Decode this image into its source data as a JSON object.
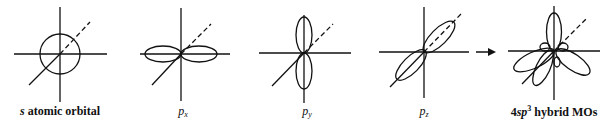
{
  "diagram": {
    "panels": [
      {
        "id": "s",
        "label_prefix": "s",
        "label_rest": " atomic orbital",
        "center_x": 60
      },
      {
        "id": "px",
        "label_main": "p",
        "label_sub": "x",
        "center_x": 181
      },
      {
        "id": "py",
        "label_main": "p",
        "label_sub": "y",
        "center_x": 304
      },
      {
        "id": "pz",
        "label_main": "p",
        "label_sub": "z",
        "center_x": 424
      },
      {
        "id": "sp3",
        "label_prefix": "4",
        "label_italic": "sp",
        "label_sup": "3",
        "label_rest": " hybrid MOs",
        "center_x": 554
      }
    ],
    "arrow": {
      "direction": "right",
      "from": "pz",
      "to": "sp3"
    },
    "colors": {
      "stroke": "#111111",
      "background": "#ffffff"
    }
  }
}
